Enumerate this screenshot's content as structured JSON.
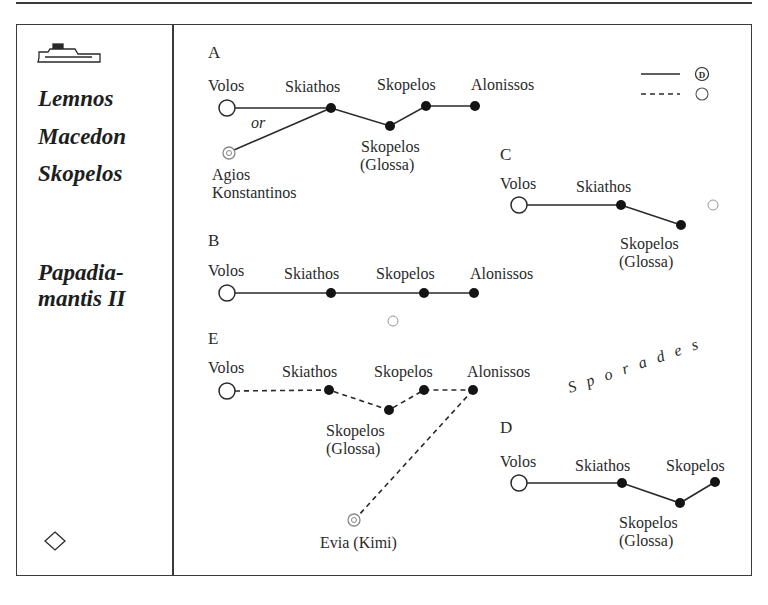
{
  "sidebar": {
    "ship_icon": "ferry-icon",
    "ships": [
      "Lemnos",
      "Macedon",
      "Skopelos"
    ],
    "ship4_line1": "Papadia-",
    "ship4_line2": "mantis II",
    "bottom_icon": "diamond-icon"
  },
  "legend": {
    "solid_line_symbol": "D",
    "dashed_line_symbol": "circle"
  },
  "routes": {
    "A": {
      "label": "A",
      "or_label": "or",
      "stops": [
        "Volos",
        "Skiathos",
        "Skopelos",
        "Alonissos"
      ],
      "glossa_line1": "Skopelos",
      "glossa_line2": "(Glossa)",
      "alt_start_line1": "Agios",
      "alt_start_line2": "Konstantinos"
    },
    "B": {
      "label": "B",
      "stops": [
        "Volos",
        "Skiathos",
        "Skopelos",
        "Alonissos"
      ]
    },
    "C": {
      "label": "C",
      "stops": [
        "Volos",
        "Skiathos"
      ],
      "glossa_line1": "Skopelos",
      "glossa_line2": "(Glossa)"
    },
    "D": {
      "label": "D",
      "stops": [
        "Volos",
        "Skiathos",
        "Skopelos"
      ],
      "glossa_line1": "Skopelos",
      "glossa_line2": "(Glossa)"
    },
    "E": {
      "label": "E",
      "stops": [
        "Volos",
        "Skiathos",
        "Skopelos",
        "Alonissos"
      ],
      "glossa_line1": "Skopelos",
      "glossa_line2": "(Glossa)",
      "branch_end": "Evia (Kimi)"
    }
  },
  "region_label": "Sporades"
}
